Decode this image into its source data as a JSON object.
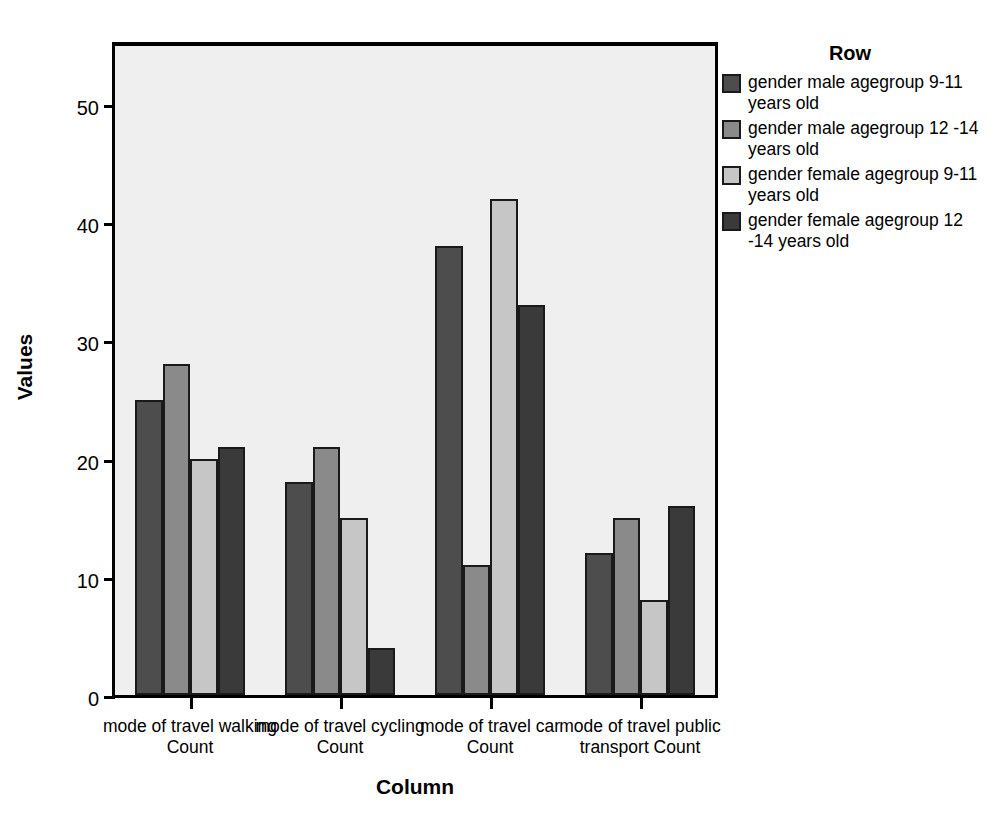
{
  "chart_data": {
    "type": "bar",
    "title": "",
    "xlabel": "Column",
    "ylabel": "Values",
    "ylim": [
      0,
      55
    ],
    "yticks": [
      0,
      10,
      20,
      30,
      40,
      50
    ],
    "grid": false,
    "legend_title": "Row",
    "legend_position": "right",
    "categories": [
      "mode of travel walking Count",
      "mode of travel cycling Count",
      "mode of travel car Count",
      "mode of travel public transport Count"
    ],
    "series": [
      {
        "name": "gender male agegroup 9-11 years old",
        "color": "#4d4d4d",
        "values": [
          25,
          18,
          38,
          12
        ]
      },
      {
        "name": "gender male agegroup 12 -14 years old",
        "color": "#8a8a8a",
        "values": [
          28,
          21,
          11,
          15
        ]
      },
      {
        "name": "gender female agegroup 9-11 years old",
        "color": "#c6c6c6",
        "values": [
          20,
          15,
          42,
          8
        ]
      },
      {
        "name": "gender female agegroup 12 -14 years old",
        "color": "#3a3a3a",
        "values": [
          21,
          4,
          33,
          16
        ]
      }
    ]
  },
  "plot": {
    "background_color": "#efefef",
    "border_color": "#000000",
    "bar_outline_color": "#1a1a1a"
  },
  "axis": {
    "y_title": "Values",
    "x_title": "Column",
    "y_tick_labels": [
      "0",
      "10",
      "20",
      "30",
      "40",
      "50"
    ],
    "x_tick_labels": [
      "mode of travel walking Count",
      "mode of travel cycling Count",
      "mode of travel car Count",
      "mode of travel public transport Count"
    ]
  },
  "legend": {
    "title": "Row",
    "items": [
      {
        "label": "gender male agegroup 9-11 years old",
        "color": "#4d4d4d"
      },
      {
        "label": "gender male agegroup 12 -14 years old",
        "color": "#8a8a8a"
      },
      {
        "label": "gender female agegroup 9-11 years old",
        "color": "#c6c6c6"
      },
      {
        "label": "gender female agegroup 12 -14 years old",
        "color": "#3a3a3a"
      }
    ]
  }
}
